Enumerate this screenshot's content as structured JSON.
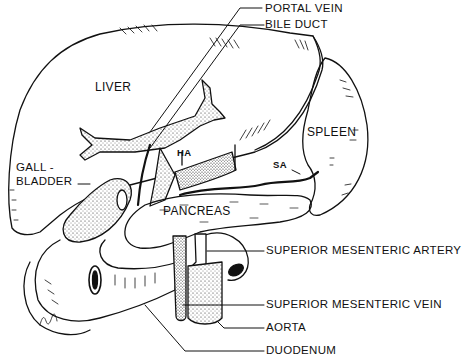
{
  "figure": {
    "type": "anatomical line drawing",
    "ink_color": "#111111",
    "background": "#ffffff"
  },
  "labels": {
    "portal_vein": "PORTAL VEIN",
    "bile_duct": "BILE DUCT",
    "liver": "LIVER",
    "spleen": "SPLEEN",
    "gallbladder_line1": "GALL -",
    "gallbladder_line2": "BLADDER",
    "hepatic_artery_abbr": "HA",
    "splenic_artery_abbr": "SA",
    "pancreas": "PANCREAS",
    "superior_mesenteric_artery": "SUPERIOR MESENTERIC ARTERY",
    "superior_mesenteric_vein": "SUPERIOR MESENTERIC VEIN",
    "aorta": "AORTA",
    "duodenum": "DUODENUM"
  }
}
